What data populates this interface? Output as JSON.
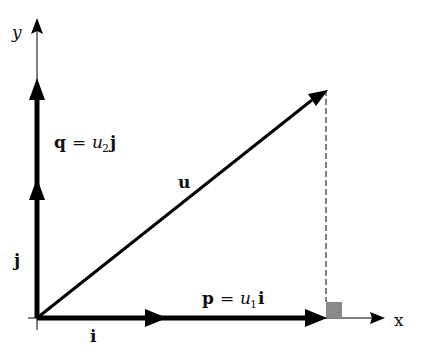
{
  "diagram": {
    "type": "vector-decomposition",
    "origin": [
      37,
      318
    ],
    "axes": {
      "x_label": "x",
      "y_label": "y"
    },
    "vectors": {
      "u": {
        "label": "u",
        "tip": [
          328,
          90
        ]
      },
      "p": {
        "label_bold": "p",
        "eq": "=",
        "coef": "u",
        "sub": "1",
        "basis": "i",
        "tip": [
          326,
          318
        ]
      },
      "q": {
        "label_bold": "q",
        "eq": "=",
        "coef": "u",
        "sub": "2",
        "basis": "j",
        "tip": [
          37,
          80
        ]
      },
      "i": {
        "label": "i",
        "tip": [
          165,
          318
        ]
      },
      "j": {
        "label": "j",
        "tip": [
          37,
          180
        ]
      }
    },
    "right_angle_marker_color": "#8a8a8a",
    "stroke_color": "#000000"
  }
}
